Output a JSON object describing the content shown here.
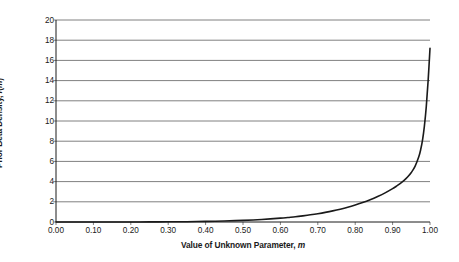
{
  "chart_data": {
    "type": "line",
    "title": "",
    "subtitle": "",
    "xlabel_plain": "Value of Unknown Parameter, m",
    "ylabel_plain": "Prior Beta Density, f(m)",
    "xlabel_parts": {
      "text": "Value of Unknown Parameter, ",
      "italic": "m"
    },
    "ylabel_parts": {
      "text": "Prior Beta Density, ",
      "italic_f": "f",
      "paren_open": "(",
      "italic_m": "m",
      "paren_close": ")"
    },
    "xlim": [
      0.0,
      1.0
    ],
    "ylim": [
      0,
      20
    ],
    "xticks": [
      "0.00",
      "0.10",
      "0.20",
      "0.30",
      "0.40",
      "0.50",
      "0.60",
      "0.70",
      "0.80",
      "0.90",
      "1.00"
    ],
    "xtick_values": [
      0.0,
      0.1,
      0.2,
      0.3,
      0.4,
      0.5,
      0.6,
      0.7,
      0.8,
      0.9,
      1.0
    ],
    "yticks": [
      "0",
      "2",
      "4",
      "6",
      "8",
      "10",
      "12",
      "14",
      "16",
      "18",
      "20"
    ],
    "ytick_values": [
      0,
      2,
      4,
      6,
      8,
      10,
      12,
      14,
      16,
      18,
      20
    ],
    "grid": {
      "horizontal": true,
      "vertical": false,
      "color": "#808080"
    },
    "legend": {
      "visible": false,
      "position": "none"
    },
    "series": [
      {
        "name": "Prior Beta Density",
        "color": "#1a1a1a",
        "width": 1.6,
        "x": [
          0.0,
          0.05,
          0.1,
          0.15,
          0.2,
          0.25,
          0.3,
          0.35,
          0.4,
          0.45,
          0.5,
          0.55,
          0.6,
          0.62,
          0.64,
          0.66,
          0.68,
          0.7,
          0.72,
          0.74,
          0.76,
          0.78,
          0.8,
          0.82,
          0.84,
          0.86,
          0.88,
          0.9,
          0.91,
          0.92,
          0.93,
          0.94,
          0.95,
          0.96,
          0.97,
          0.975,
          0.98,
          0.985,
          0.99,
          0.995,
          1.0
        ],
        "y": [
          0.0,
          0.0,
          0.0,
          0.0,
          0.0,
          0.01,
          0.02,
          0.03,
          0.06,
          0.1,
          0.16,
          0.25,
          0.38,
          0.45,
          0.52,
          0.61,
          0.71,
          0.82,
          0.95,
          1.1,
          1.27,
          1.46,
          1.68,
          1.92,
          2.2,
          2.52,
          2.88,
          3.3,
          3.54,
          3.8,
          4.1,
          4.45,
          4.9,
          5.5,
          6.45,
          7.15,
          8.1,
          9.5,
          11.4,
          14.0,
          17.2
        ]
      }
    ],
    "annotations": []
  },
  "axes": {
    "x_axis_color": "#1a1a1a",
    "y_axis_color": "#1a1a1a",
    "tick_color": "#808080"
  }
}
